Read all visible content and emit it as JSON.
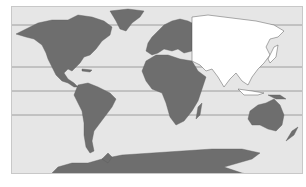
{
  "map": {
    "title": "World map — Asia highlighted",
    "projection": "equirectangular (Pacific cut)",
    "colors": {
      "ocean": "#e6e6e6",
      "land": "#6e6e6e",
      "highlight": "#ffffff",
      "coast": "#5a5a5a",
      "lines": "#8c8c8c",
      "frame": "#c8c8c8"
    },
    "highlighted_region": "Asia",
    "reference_lines": [
      "Arctic Circle",
      "Tropic of Cancer",
      "Equator",
      "Tropic of Capricorn"
    ],
    "continents": [
      "North America",
      "South America",
      "Europe",
      "Africa",
      "Asia",
      "Australia",
      "Antarctica",
      "Greenland"
    ]
  }
}
